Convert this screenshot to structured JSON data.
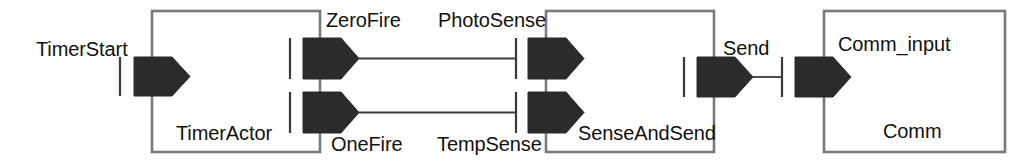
{
  "diagram": {
    "type": "component-connector-diagram",
    "title": "",
    "colors": {
      "box_border": "#7a7a7a",
      "box_fill": "#ffffff",
      "port_fill": "#2b2b2b",
      "connector": "#3a3a3a",
      "text": "#111111",
      "background": "#ffffff"
    },
    "components": [
      {
        "id": "timer-actor",
        "name": "TimerActor",
        "ports": [
          "TimerStart",
          "ZeroFire",
          "OneFire"
        ]
      },
      {
        "id": "sense-and-send",
        "name": "SenseAndSend",
        "ports": [
          "PhotoSense",
          "TempSense",
          "Send"
        ]
      },
      {
        "id": "comm",
        "name": "Comm",
        "ports": [
          "Comm_input"
        ]
      }
    ],
    "ports": {
      "timer_start": "TimerStart",
      "zero_fire": "ZeroFire",
      "one_fire": "OneFire",
      "photo_sense": "PhotoSense",
      "temp_sense": "TempSense",
      "send": "Send",
      "comm_input": "Comm_input"
    },
    "connections": [
      {
        "from": "ZeroFire",
        "to": "PhotoSense"
      },
      {
        "from": "OneFire",
        "to": "TempSense"
      },
      {
        "from": "Send",
        "to": "Comm_input"
      }
    ]
  }
}
